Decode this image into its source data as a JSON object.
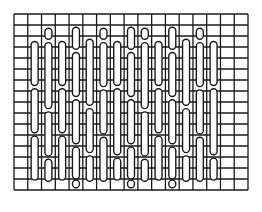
{
  "diagram": {
    "title": "",
    "type": "stitch-grid",
    "grid": {
      "left": 14,
      "top": 14,
      "right": 248,
      "bottom": 190,
      "columns": 17,
      "rows": 16,
      "line_color": "#1a1a1a",
      "line_width": 1.3
    },
    "stitch_style": {
      "fill": "#ffffff",
      "stroke": "#1a1a1a",
      "stroke_width": 1.4,
      "width": 7
    },
    "columns": [
      {
        "col": 1,
        "stitches": [
          [
            2.5,
            6.5
          ],
          [
            6.8,
            10.8
          ],
          [
            11.1,
            15.1
          ]
        ]
      },
      {
        "col": 2,
        "stitches": [
          [
            1.3,
            2.3
          ],
          [
            2.6,
            8.6
          ],
          [
            8.9,
            12.9
          ],
          [
            13.2,
            15.2
          ]
        ]
      },
      {
        "col": 3,
        "stitches": [
          [
            2.5,
            6.5
          ],
          [
            6.8,
            10.8
          ],
          [
            11.1,
            15.1
          ]
        ]
      },
      {
        "col": 4,
        "stitches": [
          [
            1.2,
            3.2
          ],
          [
            3.5,
            7.5
          ],
          [
            7.8,
            11.8
          ],
          [
            12.1,
            15.0
          ],
          [
            15.1,
            15.8
          ]
        ]
      },
      {
        "col": 5,
        "stitches": [
          [
            2.3,
            8.3
          ],
          [
            8.6,
            12.6
          ],
          [
            12.9,
            15.2
          ]
        ]
      },
      {
        "col": 6,
        "stitches": [
          [
            1.3,
            2.3
          ],
          [
            2.6,
            6.6
          ],
          [
            6.9,
            10.9
          ],
          [
            11.2,
            15.2
          ]
        ]
      },
      {
        "col": 7,
        "stitches": [
          [
            2.5,
            6.5
          ],
          [
            6.8,
            12.8
          ],
          [
            13.1,
            15.1
          ]
        ]
      },
      {
        "col": 8,
        "stitches": [
          [
            1.2,
            3.2
          ],
          [
            3.5,
            7.5
          ],
          [
            7.8,
            11.8
          ],
          [
            12.1,
            15.0
          ],
          [
            15.1,
            15.8
          ]
        ]
      },
      {
        "col": 9,
        "stitches": [
          [
            1.3,
            2.3
          ],
          [
            2.6,
            8.6
          ],
          [
            8.9,
            12.9
          ],
          [
            13.2,
            15.2
          ]
        ]
      },
      {
        "col": 10,
        "stitches": [
          [
            2.5,
            6.5
          ],
          [
            6.8,
            10.8
          ],
          [
            11.1,
            15.1
          ]
        ]
      },
      {
        "col": 11,
        "stitches": [
          [
            1.2,
            3.2
          ],
          [
            3.5,
            7.5
          ],
          [
            7.8,
            11.8
          ],
          [
            12.1,
            15.0
          ],
          [
            15.1,
            15.8
          ]
        ]
      },
      {
        "col": 12,
        "stitches": [
          [
            2.3,
            8.3
          ],
          [
            8.6,
            12.6
          ],
          [
            12.9,
            15.2
          ]
        ]
      },
      {
        "col": 13,
        "stitches": [
          [
            1.3,
            2.3
          ],
          [
            2.6,
            6.6
          ],
          [
            6.9,
            10.9
          ],
          [
            11.2,
            15.2
          ]
        ]
      },
      {
        "col": 14,
        "stitches": [
          [
            2.5,
            6.5
          ],
          [
            6.8,
            12.8
          ],
          [
            13.1,
            15.1
          ]
        ]
      }
    ]
  }
}
